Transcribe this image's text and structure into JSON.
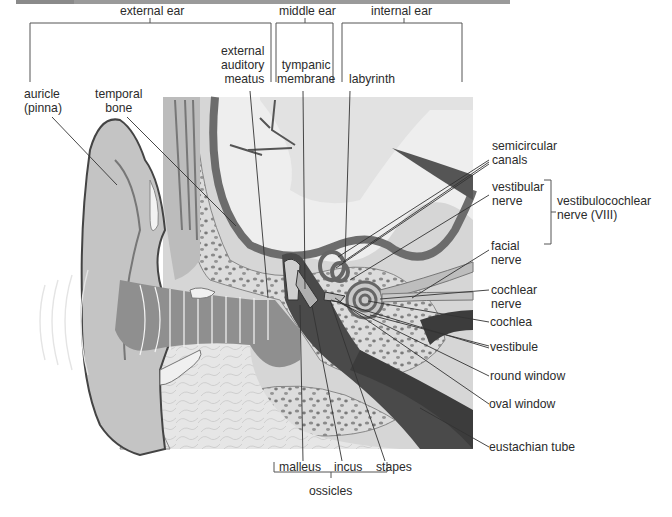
{
  "figure": {
    "regions": {
      "external_ear": "external ear",
      "middle_ear": "middle ear",
      "internal_ear": "internal ear"
    },
    "labels": {
      "auricle_1": "auricle",
      "auricle_2": "(pinna)",
      "temporal_1": "temporal",
      "temporal_2": "bone",
      "eam_1": "external",
      "eam_2": "auditory",
      "eam_3": "meatus",
      "tympanic_1": "tympanic",
      "tympanic_2": "membrane",
      "labyrinth": "labyrinth",
      "semicircular_1": "semicircular",
      "semicircular_2": "canals",
      "vestibular_1": "vestibular",
      "vestibular_2": "nerve",
      "vestibulocochlear_1": "vestibulocochlear",
      "vestibulocochlear_2": "nerve (VIII)",
      "facial_1": "facial",
      "facial_2": "nerve",
      "cochlear_1": "cochlear",
      "cochlear_2": "nerve",
      "cochlea": "cochlea",
      "vestibule": "vestibule",
      "round_window": "round window",
      "oval_window": "oval window",
      "eustachian_tube": "eustachian tube",
      "malleus": "malleus",
      "incus": "incus",
      "stapes": "stapes",
      "ossicles": "ossicles"
    }
  }
}
